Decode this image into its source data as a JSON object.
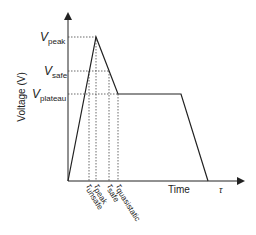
{
  "diagram": {
    "y_axis_label": "Voltage (V)",
    "x_axis_label": "Time",
    "x_axis_end_symbol": "τ",
    "voltage_levels": [
      {
        "symbol": "V",
        "subscript": "peak"
      },
      {
        "symbol": "V",
        "subscript": "safe"
      },
      {
        "symbol": "V",
        "subscript": "plateau"
      }
    ],
    "time_markers": [
      {
        "symbol": "τ",
        "subscript": "unsafe"
      },
      {
        "symbol": "τ",
        "subscript": "peak"
      },
      {
        "symbol": "τ",
        "subscript": "safe"
      },
      {
        "symbol": "τ",
        "subscript": "quasistatic"
      }
    ],
    "colors": {
      "line": "#222222",
      "dotted": "#444444",
      "background": "#ffffff"
    }
  }
}
